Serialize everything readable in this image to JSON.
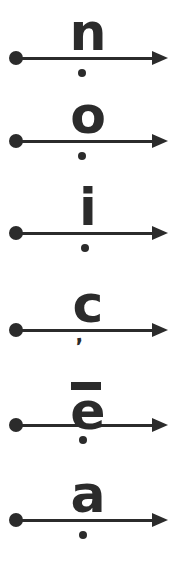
{
  "page": {
    "background_color": "#ffffff",
    "ink_color": "#2b2b2b",
    "width": 177,
    "height": 563
  },
  "rows": [
    {
      "id": "row-n",
      "letter": "n",
      "letter_name": "letter-n",
      "line_y": 58,
      "glyph_top": 12,
      "glyph_size": 52,
      "glyph_left": 60,
      "mark_below": "dot",
      "mark_below_name": "dot-below",
      "mark_below_x": 82,
      "mark_below_y": 73,
      "mark_above": "none"
    },
    {
      "id": "row-o",
      "letter": "o",
      "letter_name": "letter-o",
      "line_y": 141,
      "glyph_top": 99,
      "glyph_size": 52,
      "glyph_left": 60,
      "mark_below": "dot",
      "mark_below_name": "dot-below",
      "mark_below_x": 82,
      "mark_below_y": 156,
      "mark_above": "none"
    },
    {
      "id": "row-i",
      "letter": "i",
      "letter_name": "letter-i",
      "line_y": 233,
      "glyph_top": 191,
      "glyph_size": 52,
      "glyph_left": 60,
      "mark_below": "dot",
      "mark_below_name": "dot-below",
      "mark_below_x": 85,
      "mark_below_y": 248,
      "mark_above": "tittle"
    },
    {
      "id": "row-c",
      "letter": "c",
      "letter_name": "letter-c",
      "line_y": 330,
      "glyph_top": 289,
      "glyph_size": 52,
      "glyph_left": 60,
      "mark_below": "comma",
      "mark_below_name": "comma-below",
      "mark_below_x": 76,
      "mark_below_y": 336,
      "mark_above": "none"
    },
    {
      "id": "row-e-macron",
      "letter": "e",
      "letter_name": "letter-e-macron",
      "line_y": 425,
      "glyph_top": 382,
      "glyph_size": 52,
      "glyph_left": 60,
      "mark_below": "dot",
      "mark_below_name": "dot-below",
      "mark_below_x": 83,
      "mark_below_y": 440,
      "mark_above": "macron"
    },
    {
      "id": "row-a",
      "letter": "a",
      "letter_name": "letter-a",
      "line_y": 520,
      "glyph_top": 478,
      "glyph_size": 52,
      "glyph_left": 60,
      "mark_below": "dot",
      "mark_below_name": "dot-below",
      "mark_below_x": 83,
      "mark_below_y": 535,
      "mark_above": "none"
    }
  ],
  "arrow": {
    "start_x": 16,
    "end_x": 152,
    "tip_x": 168,
    "line_thickness": 3,
    "head_width": 16,
    "head_height": 7,
    "endpoint_radius": 7,
    "label": "rightward arrow"
  },
  "marks": {
    "dot_radius": 4,
    "tittle_radius": 4,
    "macron_width": 30,
    "macron_height": 8,
    "comma_glyph": "’"
  }
}
